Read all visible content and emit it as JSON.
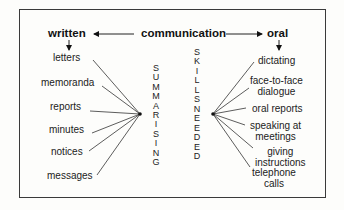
{
  "diagram": {
    "title": "communication",
    "left_heading": "written",
    "right_heading": "oral",
    "center_left_vertical": "SUMMARISING",
    "center_right_vertical_1": "SKILLS",
    "center_right_vertical_2": "NEEDED",
    "written_items": [
      "letters",
      "memoranda",
      "reports",
      "minutes",
      "notices",
      "messages"
    ],
    "oral_items": [
      {
        "line1": "dictating",
        "line2": ""
      },
      {
        "line1": "face-to-face",
        "line2": "dialogue"
      },
      {
        "line1": "oral reports",
        "line2": ""
      },
      {
        "line1": "speaking at",
        "line2": "meetings"
      },
      {
        "line1": "giving",
        "line2": "instructions"
      },
      {
        "line1": "telephone",
        "line2": "calls"
      }
    ]
  }
}
